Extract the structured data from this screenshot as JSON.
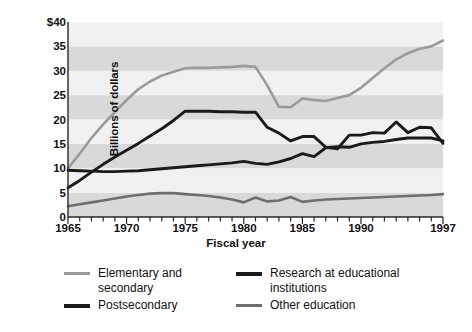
{
  "chart_data": {
    "type": "line",
    "title": "",
    "xlabel": "Fiscal year",
    "ylabel": "Billions of dollars",
    "xlim": [
      1965,
      1997
    ],
    "ylim": [
      0,
      40
    ],
    "grid": "horizontal-alternating-bands",
    "legend_position": "below",
    "x_tick_labels": [
      "1965",
      "1970",
      "1975",
      "1980",
      "1985",
      "1990",
      "1997"
    ],
    "x_tick_values": [
      1965,
      1970,
      1975,
      1980,
      1985,
      1990,
      1997
    ],
    "y_tick_labels": [
      "0",
      "5",
      "10",
      "15",
      "20",
      "25",
      "30",
      "35",
      "$40"
    ],
    "y_tick_values": [
      0,
      5,
      10,
      15,
      20,
      25,
      30,
      35,
      40
    ],
    "x": [
      1965,
      1966,
      1967,
      1968,
      1969,
      1970,
      1971,
      1972,
      1973,
      1974,
      1975,
      1976,
      1977,
      1978,
      1979,
      1980,
      1981,
      1982,
      1983,
      1984,
      1985,
      1986,
      1987,
      1988,
      1989,
      1990,
      1991,
      1992,
      1993,
      1994,
      1995,
      1996,
      1997
    ],
    "series": [
      {
        "name": "Elementary and secondary",
        "color": "#9a9a9a",
        "values": [
          10.0,
          13.0,
          16.2,
          19.0,
          21.5,
          24.0,
          26.2,
          27.8,
          29.0,
          29.8,
          30.5,
          30.6,
          30.6,
          30.7,
          30.8,
          31.0,
          30.8,
          27.0,
          22.6,
          22.5,
          24.3,
          24.0,
          23.8,
          24.4,
          25.0,
          26.5,
          28.5,
          30.5,
          32.3,
          33.6,
          34.5,
          35.0,
          36.2
        ]
      },
      {
        "name": "Postsecondary",
        "color": "#1a1a1a",
        "values": [
          9.6,
          9.5,
          9.4,
          9.3,
          9.3,
          9.4,
          9.5,
          9.7,
          9.9,
          10.1,
          10.3,
          10.5,
          10.7,
          10.9,
          11.1,
          11.4,
          11.0,
          10.8,
          11.3,
          12.0,
          13.0,
          12.4,
          14.2,
          14.4,
          14.3,
          15.0,
          15.3,
          15.5,
          15.9,
          16.2,
          16.2,
          16.2,
          15.6
        ]
      },
      {
        "name": "Research at educational institutions",
        "color": "#1a1a1a",
        "values": [
          6.0,
          7.5,
          9.2,
          10.8,
          12.3,
          13.7,
          15.1,
          16.6,
          18.1,
          19.8,
          21.7,
          21.7,
          21.7,
          21.6,
          21.6,
          21.5,
          21.5,
          18.4,
          17.2,
          15.6,
          16.5,
          16.5,
          14.3,
          14.0,
          16.8,
          16.8,
          17.3,
          17.2,
          19.5,
          17.3,
          18.4,
          18.3,
          15.1
        ]
      },
      {
        "name": "Other education",
        "color": "#6e6e6e",
        "values": [
          2.2,
          2.6,
          3.0,
          3.4,
          3.8,
          4.2,
          4.5,
          4.8,
          4.9,
          4.9,
          4.7,
          4.5,
          4.3,
          4.0,
          3.6,
          3.0,
          4.0,
          3.2,
          3.4,
          4.1,
          3.1,
          3.4,
          3.6,
          3.7,
          3.8,
          3.9,
          4.0,
          4.1,
          4.2,
          4.3,
          4.4,
          4.5,
          4.7
        ]
      }
    ]
  },
  "axis": {
    "y_title": "Billions of dollars",
    "x_title": "Fiscal year"
  },
  "legend": {
    "items": [
      {
        "label": "Elementary and\nsecondary",
        "color": "#9a9a9a",
        "thickness": 3
      },
      {
        "label": "Research at educational\ninstitutions",
        "color": "#1a1a1a",
        "thickness": 4
      },
      {
        "label": "Postsecondary",
        "color": "#1a1a1a",
        "thickness": 4
      },
      {
        "label": "Other education",
        "color": "#6e6e6e",
        "thickness": 3
      }
    ]
  },
  "style": {
    "band_light": "#f1f1f1",
    "band_dark": "#d9d9d9",
    "axis_color": "#2a2a2a",
    "background": "#ffffff"
  }
}
